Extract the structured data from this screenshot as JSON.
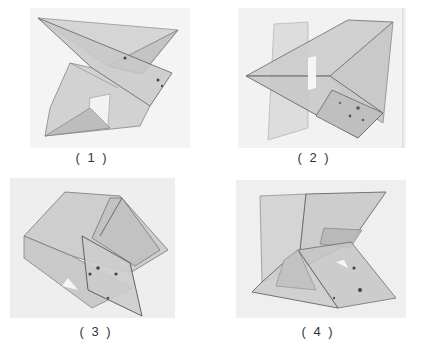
{
  "figures": [
    {
      "id": 1,
      "caption": "( 1 )",
      "description": "Translucent polyhedral model, bow-tie form pointing right"
    },
    {
      "id": 2,
      "caption": "( 2 )",
      "description": "Translucent polyhedral model, arrow form pointing left"
    },
    {
      "id": 3,
      "caption": "( 3 )",
      "description": "Translucent polyhedral model, folded hexagonal form"
    },
    {
      "id": 4,
      "caption": "( 4 )",
      "description": "Translucent polyhedral model, stacked wedge form"
    }
  ],
  "colors": {
    "background": "#ffffff",
    "photo_bg": "#f1f1f1",
    "panel_fill": "#c8c8c8",
    "edge": "#6a6a6a",
    "caption_text": "#333333"
  }
}
